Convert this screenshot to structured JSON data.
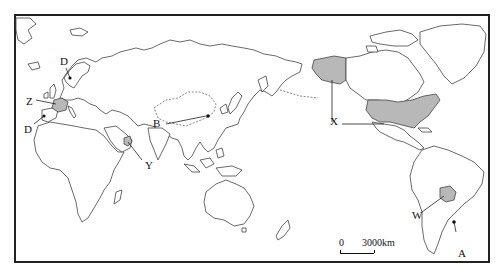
{
  "map": {
    "type": "world political outline map (Pacific-centered)",
    "frame": {
      "left": 14,
      "top": 14,
      "right": 490,
      "bottom": 263
    },
    "colors": {
      "land": "#ffffff",
      "shaded": "#b8b8b8",
      "outline": "#444444",
      "frame": "#222222"
    },
    "labels": [
      {
        "id": "C",
        "text": "C",
        "note": "point in southern Norway/Sweden"
      },
      {
        "id": "Z",
        "text": "Z",
        "note": "shaded country France"
      },
      {
        "id": "D",
        "text": "D",
        "note": "point in Portugal/Spain"
      },
      {
        "id": "Y",
        "text": "Y",
        "note": "shaded country in Arabian Peninsula (UAE/Oman)"
      },
      {
        "id": "B",
        "text": "B",
        "note": "point in northern China"
      },
      {
        "id": "X",
        "text": "X",
        "note": "shaded country United States (incl. Alaska)"
      },
      {
        "id": "W",
        "text": "W",
        "note": "shaded country Bolivia"
      },
      {
        "id": "A",
        "text": "A",
        "note": "point in Argentina/Uruguay"
      }
    ],
    "shaded_regions": [
      "France",
      "UAE/Oman",
      "United States",
      "Alaska",
      "Bolivia"
    ],
    "scale": {
      "zero": "0",
      "distance": "3000km"
    }
  }
}
